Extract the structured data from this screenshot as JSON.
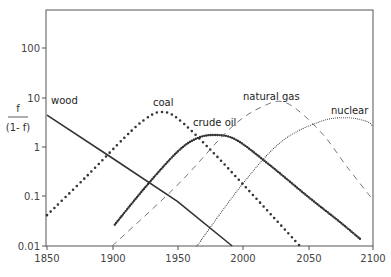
{
  "chart_data": {
    "type": "line",
    "title": "",
    "xlabel": "",
    "ylabel": {
      "numerator": "f",
      "denominator": "(1- f)"
    },
    "yscale": "log",
    "xlim": [
      1850,
      2100
    ],
    "ylim": [
      0.01,
      1000
    ],
    "grid": false,
    "legend": "inline labels",
    "x_ticks": [
      "1850",
      "1900",
      "1950",
      "2000",
      "2050",
      "2100"
    ],
    "y_ticks": [
      "100",
      "10",
      "1",
      "0.1",
      "0.01"
    ],
    "series": [
      {
        "name": "wood",
        "style": "solid",
        "points": [
          [
            1850,
            4.4
          ],
          [
            1900,
            0.6
          ],
          [
            1950,
            0.08
          ],
          [
            1992,
            0.01
          ]
        ],
        "label_pos": [
          1853,
          12
        ]
      },
      {
        "name": "coal",
        "style": "large-dots",
        "points": [
          [
            1850,
            0.042
          ],
          [
            1880,
            0.25
          ],
          [
            1910,
            1.6
          ],
          [
            1925,
            3.6
          ],
          [
            1937,
            5.1
          ],
          [
            1950,
            3.8
          ],
          [
            1975,
            0.9
          ],
          [
            2000,
            0.18
          ],
          [
            2025,
            0.035
          ],
          [
            2044,
            0.01
          ]
        ],
        "label_pos": [
          1932,
          11
        ]
      },
      {
        "name": "crude oil",
        "style": "dense-dots",
        "points": [
          [
            1902,
            0.027
          ],
          [
            1925,
            0.15
          ],
          [
            1950,
            0.8
          ],
          [
            1965,
            1.5
          ],
          [
            1979,
            1.75
          ],
          [
            1995,
            1.4
          ],
          [
            2020,
            0.45
          ],
          [
            2050,
            0.1
          ],
          [
            2075,
            0.03
          ],
          [
            2090,
            0.014
          ]
        ],
        "label_pos": [
          1962,
          2.6
        ]
      },
      {
        "name": "natural gas",
        "style": "dashed",
        "points": [
          [
            1900,
            0.01
          ],
          [
            1950,
            0.17
          ],
          [
            1990,
            2.3
          ],
          [
            2015,
            6.5
          ],
          [
            2034,
            7.7
          ],
          [
            2060,
            2.0
          ],
          [
            2080,
            0.4
          ],
          [
            2100,
            0.085
          ]
        ],
        "label_pos": [
          2009,
          13
        ]
      },
      {
        "name": "nuclear",
        "style": "fine-dots",
        "points": [
          [
            1965,
            0.01
          ],
          [
            2000,
            0.18
          ],
          [
            2030,
            1.3
          ],
          [
            2060,
            3.3
          ],
          [
            2080,
            3.9
          ],
          [
            2095,
            3.3
          ],
          [
            2100,
            2.6
          ]
        ],
        "label_pos": [
          2067,
          6.5
        ]
      }
    ]
  },
  "axis": {
    "x_ticks": [
      "1850",
      "1900",
      "1950",
      "2000",
      "2050",
      "2100"
    ],
    "y_ticks": [
      "100",
      "10",
      "1",
      "0.1",
      "0.01"
    ],
    "ylabel_num": "f",
    "ylabel_den": "(1- f)"
  },
  "labels": {
    "wood": "wood",
    "coal": "coal",
    "crude_oil": "crude oil",
    "natural_gas": "natural gas",
    "nuclear": "nuclear"
  }
}
